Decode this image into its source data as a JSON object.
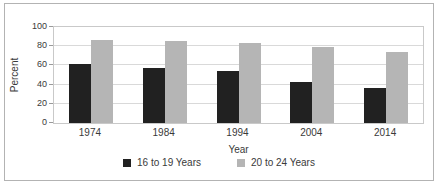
{
  "figure": {
    "background_color": "#ffffff",
    "border_color": "#b3b3b3"
  },
  "chart_data": {
    "type": "bar",
    "categories": [
      "1974",
      "1984",
      "1994",
      "2004",
      "2014"
    ],
    "series": [
      {
        "name": "16 to 19 Years",
        "color": "#212121",
        "values": [
          61,
          57,
          54,
          43,
          36
        ]
      },
      {
        "name": "20 to 24 Years",
        "color": "#b5b5b5",
        "values": [
          86,
          85,
          83,
          79,
          74
        ]
      }
    ],
    "xlabel": "Year",
    "ylabel": "Percent",
    "ylim": [
      0,
      100
    ],
    "yticks": [
      0,
      20,
      40,
      60,
      80,
      100
    ],
    "grid": true,
    "gridline_color": "#d9d9d9",
    "legend_position": "bottom"
  }
}
